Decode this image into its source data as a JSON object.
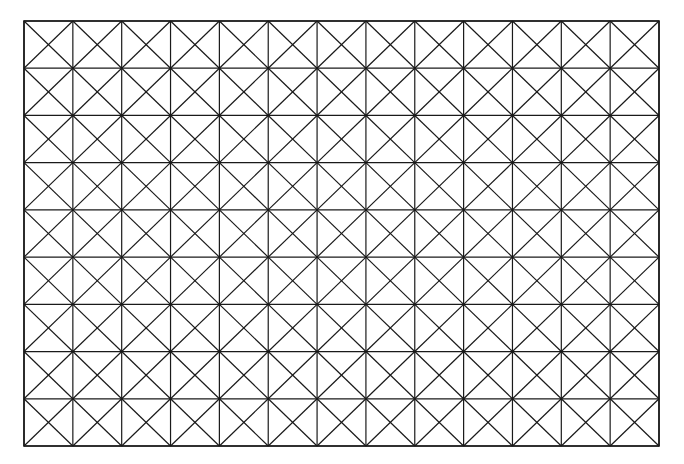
{
  "diagram": {
    "type": "triangulated-grid",
    "columns": 13,
    "rows": 9,
    "cell_pattern": "square-with-both-diagonals",
    "bounds": {
      "left": 24,
      "top": 21,
      "right": 659,
      "bottom": 446
    },
    "line_color": "#1a1a1a",
    "background": "#ffffff",
    "line_width": 1.2
  }
}
